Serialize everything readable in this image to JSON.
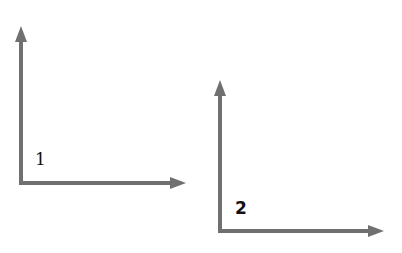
{
  "diagram": {
    "stroke_color": "#707070",
    "label_color": "#111111",
    "axes": [
      {
        "label": "1",
        "origin": [
          21,
          183
        ],
        "vertical_tip": [
          21,
          26
        ],
        "horizontal_tip": [
          186,
          183
        ],
        "label_pos": [
          35,
          152
        ]
      },
      {
        "label": "2",
        "origin": [
          220,
          231
        ],
        "vertical_tip": [
          220,
          80
        ],
        "horizontal_tip": [
          384,
          231
        ],
        "label_pos": [
          235,
          200
        ]
      }
    ]
  }
}
